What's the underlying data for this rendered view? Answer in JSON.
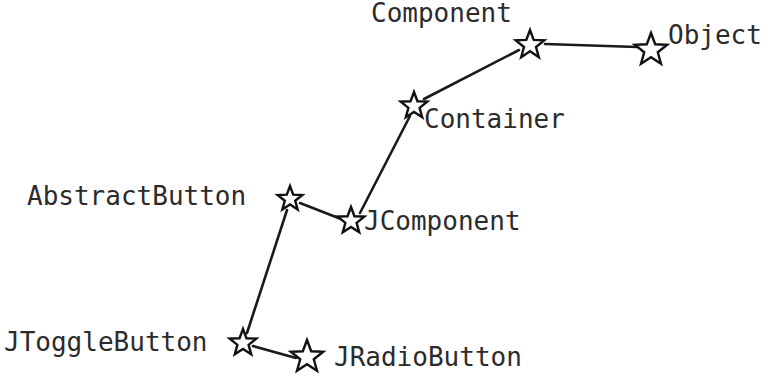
{
  "diagram": {
    "background_color": "#ffffff",
    "node_color": "#ffffff",
    "node_stroke_color": "#111111",
    "edge_color": "#1a1a1a",
    "text_color": "#2b2b2b",
    "node_shape": "star",
    "nodes": [
      {
        "id": "object",
        "label": "Object",
        "x": 651,
        "y": 50,
        "size": 17,
        "label_x": 668,
        "label_y": 22
      },
      {
        "id": "component",
        "label": "Component",
        "x": 530,
        "y": 45,
        "size": 15,
        "label_x": 371,
        "label_y": 0
      },
      {
        "id": "container",
        "label": "Container",
        "x": 414,
        "y": 106,
        "size": 14,
        "label_x": 424,
        "label_y": 106
      },
      {
        "id": "jcomponent",
        "label": "JComponent",
        "x": 351,
        "y": 221,
        "size": 14,
        "label_x": 364,
        "label_y": 208
      },
      {
        "id": "abstractbutton",
        "label": "AbstractButton",
        "x": 290,
        "y": 199,
        "size": 13,
        "label_x": 27,
        "label_y": 183
      },
      {
        "id": "jtogglebutton",
        "label": "JToggleButton",
        "x": 243,
        "y": 343,
        "size": 14,
        "label_x": 4,
        "label_y": 329
      },
      {
        "id": "jradiobutton",
        "label": "JRadioButton",
        "x": 307,
        "y": 357,
        "size": 17,
        "label_x": 334,
        "label_y": 344
      }
    ],
    "edges": [
      {
        "id": "edge-component-object",
        "from": "component",
        "to": "object",
        "x1": 545,
        "y1": 44,
        "x2": 637,
        "y2": 47
      },
      {
        "id": "edge-container-component",
        "from": "container",
        "to": "component",
        "x1": 424,
        "y1": 99,
        "x2": 519,
        "y2": 50
      },
      {
        "id": "edge-jcomponent-container",
        "from": "jcomponent",
        "to": "container",
        "x1": 360,
        "y1": 213,
        "x2": 410,
        "y2": 116
      },
      {
        "id": "edge-abstractbutton-jcomponent",
        "from": "abstractbutton",
        "to": "jcomponent",
        "x1": 300,
        "y1": 203,
        "x2": 341,
        "y2": 219
      },
      {
        "id": "edge-jtogglebutton-abstractbutton",
        "from": "jtogglebutton",
        "to": "abstractbutton",
        "x1": 247,
        "y1": 333,
        "x2": 287,
        "y2": 210
      },
      {
        "id": "edge-jradiobutton-jtogglebutton",
        "from": "jradiobutton",
        "to": "jtogglebutton",
        "x1": 253,
        "y1": 346,
        "x2": 296,
        "y2": 358
      }
    ]
  }
}
